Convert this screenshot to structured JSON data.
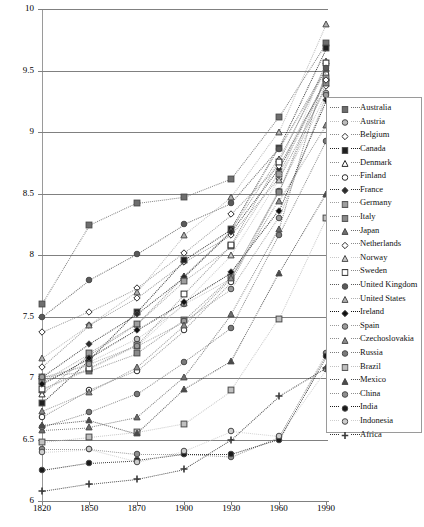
{
  "chart_data": {
    "type": "line",
    "title": "",
    "xlabel": "",
    "ylabel": "",
    "grid": true,
    "legend_position": "right",
    "x": [
      1820,
      1850,
      1870,
      1900,
      1930,
      1960,
      1990
    ],
    "xtick_labels": [
      "1820",
      "1850",
      "1870",
      "1900",
      "1930",
      "1960",
      "1990"
    ],
    "ytick_labels": [
      "10",
      "9.5",
      "9",
      "8.5",
      "8",
      "7.5",
      "7",
      "6.5",
      "6"
    ],
    "ytick_values": [
      10,
      9.5,
      9,
      8.5,
      8,
      7.5,
      7,
      6.5,
      6
    ],
    "ylim": [
      6,
      10
    ],
    "xlim": [
      1820,
      1990
    ],
    "series": [
      {
        "name": "Australia",
        "marker": "square",
        "fill": "#6e6e6e",
        "values": [
          7.6,
          8.24,
          8.42,
          8.47,
          8.62,
          9.12,
          9.72
        ]
      },
      {
        "name": "Austria",
        "marker": "circle",
        "fill": "#bdbdbd",
        "values": [
          6.97,
          7.13,
          7.32,
          7.6,
          7.81,
          8.52,
          9.32
        ]
      },
      {
        "name": "Belgium",
        "marker": "diamondo",
        "fill": "#ffffff",
        "values": [
          7.09,
          7.43,
          7.65,
          7.94,
          8.16,
          8.62,
          9.37
        ]
      },
      {
        "name": "Canada",
        "marker": "square",
        "fill": "#1f1f1f",
        "values": [
          6.8,
          7.15,
          7.54,
          7.96,
          8.21,
          8.87,
          9.68
        ]
      },
      {
        "name": "Denmark",
        "marker": "triangleo",
        "fill": "#ffffff",
        "values": [
          6.87,
          7.19,
          7.44,
          7.83,
          8.2,
          8.78,
          9.52
        ]
      },
      {
        "name": "Finland",
        "marker": "circleo",
        "fill": "#ffffff",
        "values": [
          6.68,
          6.9,
          7.06,
          7.39,
          7.78,
          8.51,
          9.47
        ]
      },
      {
        "name": "France",
        "marker": "diamond",
        "fill": "#2b2b2b",
        "values": [
          7.01,
          7.28,
          7.52,
          7.82,
          8.19,
          8.7,
          9.43
        ]
      },
      {
        "name": "Germany",
        "marker": "square",
        "fill": "#9e9e9e",
        "values": [
          6.97,
          7.2,
          7.44,
          7.79,
          8.07,
          8.66,
          9.44
        ]
      },
      {
        "name": "Italy",
        "marker": "square",
        "fill": "#8a8a8a",
        "values": [
          7.01,
          7.06,
          7.2,
          7.47,
          7.82,
          8.51,
          9.4
        ]
      },
      {
        "name": "Japan",
        "marker": "triangle",
        "fill": "#6e6e6e",
        "values": [
          6.58,
          6.6,
          6.68,
          7.01,
          7.52,
          8.21,
          9.51
        ]
      },
      {
        "name": "Netherlands",
        "marker": "diamondo",
        "fill": "#ffffff",
        "values": [
          7.37,
          7.54,
          7.73,
          8.02,
          8.33,
          8.72,
          9.42
        ]
      },
      {
        "name": "Norway",
        "marker": "triangle",
        "fill": "#c8c8c8",
        "values": [
          6.9,
          7.07,
          7.26,
          7.61,
          8.0,
          8.61,
          9.58
        ]
      },
      {
        "name": "Sweden",
        "marker": "squareo",
        "fill": "#ffffff",
        "values": [
          6.91,
          7.08,
          7.27,
          7.68,
          8.08,
          8.76,
          9.56
        ]
      },
      {
        "name": "United Kingdom",
        "marker": "circle",
        "fill": "#5a5a5a",
        "values": [
          7.5,
          7.8,
          8.01,
          8.25,
          8.42,
          8.86,
          9.52
        ]
      },
      {
        "name": "United States",
        "marker": "triangle",
        "fill": "#b0b0b0",
        "values": [
          7.16,
          7.43,
          7.7,
          8.16,
          8.47,
          9.0,
          9.88
        ]
      },
      {
        "name": "Ireland",
        "marker": "diamond",
        "fill": "#111111",
        "values": [
          6.95,
          7.16,
          7.39,
          7.62,
          7.86,
          8.36,
          9.26
        ]
      },
      {
        "name": "Spain",
        "marker": "circle",
        "fill": "#9a9a9a",
        "values": [
          7.01,
          7.11,
          7.26,
          7.46,
          7.72,
          8.3,
          9.3
        ]
      },
      {
        "name": "Czechoslovakia",
        "marker": "triangle",
        "fill": "#8c8c8c",
        "values": [
          6.73,
          6.89,
          7.09,
          7.43,
          7.81,
          8.44,
          9.06
        ]
      },
      {
        "name": "Russia",
        "marker": "circle",
        "fill": "#7a7a7a",
        "values": [
          6.6,
          6.72,
          6.87,
          7.13,
          7.41,
          8.16,
          8.93
        ]
      },
      {
        "name": "Brazil",
        "marker": "square",
        "fill": "#c0c0c0",
        "values": [
          6.48,
          6.52,
          6.56,
          6.63,
          6.9,
          7.48,
          8.3
        ]
      },
      {
        "name": "Mexico",
        "marker": "triangle",
        "fill": "#4a4a4a",
        "values": [
          6.62,
          6.66,
          6.55,
          6.91,
          7.14,
          7.85,
          8.5
        ]
      },
      {
        "name": "China",
        "marker": "circle",
        "fill": "#8e8e8e",
        "values": [
          6.42,
          6.42,
          6.38,
          6.38,
          6.36,
          6.52,
          7.2
        ]
      },
      {
        "name": "India",
        "marker": "circle",
        "fill": "#1a1a1a",
        "values": [
          6.25,
          6.31,
          6.33,
          6.38,
          6.38,
          6.5,
          7.18
        ]
      },
      {
        "name": "Indonesia",
        "marker": "circle",
        "fill": "#cdcdcd",
        "values": [
          6.4,
          6.42,
          6.32,
          6.41,
          6.57,
          6.53,
          7.07
        ]
      },
      {
        "name": "Africa",
        "marker": "plus",
        "fill": "#333333",
        "values": [
          6.08,
          6.14,
          6.18,
          6.26,
          6.5,
          6.85,
          7.08
        ]
      }
    ]
  },
  "legend": {
    "items": [
      {
        "label": "Australia"
      },
      {
        "label": "Austria"
      },
      {
        "label": "Belgium"
      },
      {
        "label": "Canada"
      },
      {
        "label": "Denmark"
      },
      {
        "label": "Finland"
      },
      {
        "label": "France"
      },
      {
        "label": "Germany"
      },
      {
        "label": "Italy"
      },
      {
        "label": "Japan"
      },
      {
        "label": "Netherlands"
      },
      {
        "label": "Norway"
      },
      {
        "label": "Sweden"
      },
      {
        "label": "United Kingdom"
      },
      {
        "label": "United States"
      },
      {
        "label": "Ireland"
      },
      {
        "label": "Spain"
      },
      {
        "label": "Czechoslovakia"
      },
      {
        "label": "Russia"
      },
      {
        "label": "Brazil"
      },
      {
        "label": "Mexico"
      },
      {
        "label": "China"
      },
      {
        "label": "India"
      },
      {
        "label": "Indonesia"
      },
      {
        "label": "Africa"
      }
    ]
  },
  "colors": {
    "gridline": "#808080",
    "axis": "#808080",
    "legend_border": "#9a9a9a",
    "connector": "#9a9a9a",
    "text": "#000000"
  }
}
